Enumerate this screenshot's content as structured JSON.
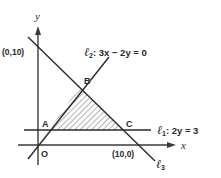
{
  "diagram": {
    "axes": {
      "x_label": "x",
      "y_label": "y",
      "origin_label": "O"
    },
    "points": {
      "y_intercept": "(0,10)",
      "x_intercept": "(10,0)",
      "A": "A",
      "B": "B",
      "C": "C"
    },
    "lines": {
      "l1": {
        "name": "ℓ",
        "sub": "1",
        "eq": ": 2y = 3"
      },
      "l2": {
        "name": "ℓ",
        "sub": "2",
        "eq": ": 3x − 2y = 0"
      },
      "l3": {
        "name": "ℓ",
        "sub": "3"
      }
    },
    "shaded_region": "triangle ABC",
    "colors": {
      "ink": "#2a2a2a",
      "background": "#ffffff"
    }
  }
}
